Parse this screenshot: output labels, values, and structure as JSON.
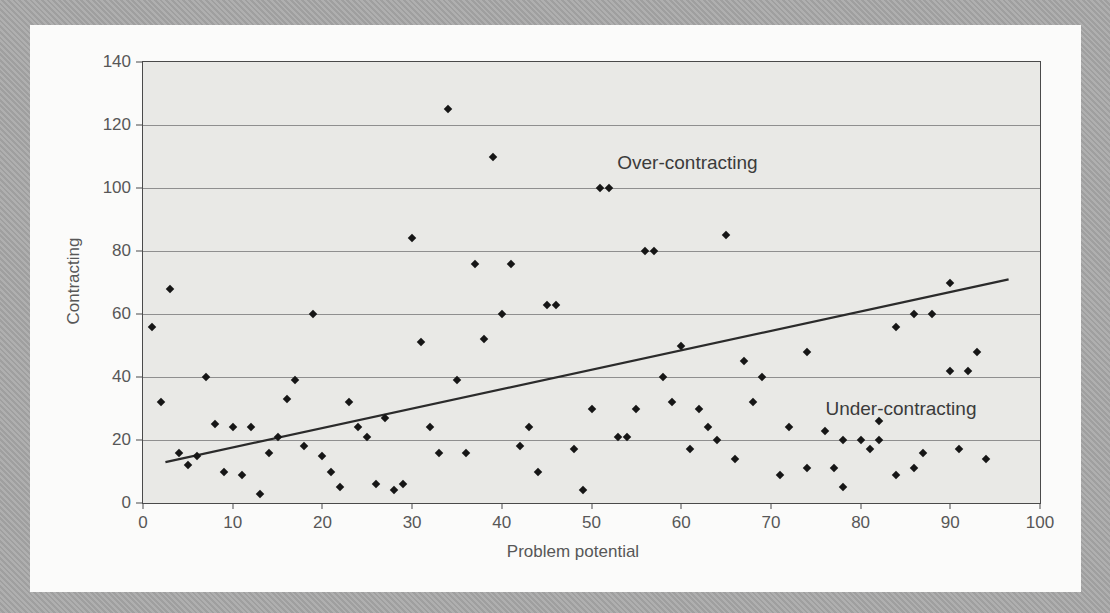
{
  "chart_data": {
    "type": "scatter",
    "title": "",
    "xlabel": "Problem potential",
    "ylabel": "Contracting",
    "xlim": [
      0,
      100
    ],
    "ylim": [
      0,
      140
    ],
    "x_ticks": [
      0,
      10,
      20,
      30,
      40,
      50,
      60,
      70,
      80,
      90,
      100
    ],
    "y_ticks": [
      0,
      20,
      40,
      60,
      80,
      100,
      120,
      140
    ],
    "grid": "horizontal-only",
    "legend": "none",
    "marker": "diamond",
    "annotations": [
      {
        "text": "Over-contracting",
        "x": 60.7,
        "y": 108
      },
      {
        "text": "Under-contracting",
        "x": 84.5,
        "y": 30
      }
    ],
    "trend_line": {
      "x1": 2.5,
      "y1": 13,
      "x2": 96.5,
      "y2": 71
    },
    "points": [
      [
        1,
        56
      ],
      [
        2,
        32
      ],
      [
        3,
        68
      ],
      [
        4,
        16
      ],
      [
        5,
        12
      ],
      [
        6,
        15
      ],
      [
        7,
        40
      ],
      [
        8,
        25
      ],
      [
        9,
        10
      ],
      [
        10,
        24
      ],
      [
        11,
        9
      ],
      [
        12,
        24
      ],
      [
        13,
        3
      ],
      [
        14,
        16
      ],
      [
        15,
        21
      ],
      [
        16,
        33
      ],
      [
        17,
        39
      ],
      [
        18,
        18
      ],
      [
        19,
        60
      ],
      [
        20,
        15
      ],
      [
        21,
        10
      ],
      [
        22,
        5
      ],
      [
        23,
        32
      ],
      [
        24,
        24
      ],
      [
        25,
        21
      ],
      [
        26,
        6
      ],
      [
        27,
        27
      ],
      [
        28,
        4
      ],
      [
        29,
        6
      ],
      [
        30,
        84
      ],
      [
        31,
        51
      ],
      [
        32,
        24
      ],
      [
        33,
        16
      ],
      [
        34,
        125
      ],
      [
        35,
        39
      ],
      [
        36,
        16
      ],
      [
        37,
        76
      ],
      [
        38,
        52
      ],
      [
        39,
        110
      ],
      [
        40,
        60
      ],
      [
        41,
        76
      ],
      [
        42,
        18
      ],
      [
        43,
        24
      ],
      [
        44,
        10
      ],
      [
        45,
        63
      ],
      [
        46,
        63
      ],
      [
        48,
        17
      ],
      [
        49,
        4
      ],
      [
        50,
        30
      ],
      [
        51,
        100
      ],
      [
        52,
        100
      ],
      [
        53,
        21
      ],
      [
        54,
        21
      ],
      [
        55,
        30
      ],
      [
        56,
        80
      ],
      [
        57,
        80
      ],
      [
        58,
        40
      ],
      [
        59,
        32
      ],
      [
        60,
        50
      ],
      [
        61,
        17
      ],
      [
        62,
        30
      ],
      [
        63,
        24
      ],
      [
        64,
        20
      ],
      [
        65,
        85
      ],
      [
        66,
        14
      ],
      [
        67,
        45
      ],
      [
        68,
        32
      ],
      [
        69,
        40
      ],
      [
        71,
        9
      ],
      [
        72,
        24
      ],
      [
        74,
        11
      ],
      [
        74,
        48
      ],
      [
        76,
        23
      ],
      [
        77,
        11
      ],
      [
        78,
        5
      ],
      [
        78,
        20
      ],
      [
        80,
        20
      ],
      [
        81,
        17
      ],
      [
        82,
        20
      ],
      [
        82,
        26
      ],
      [
        84,
        9
      ],
      [
        84,
        56
      ],
      [
        86,
        11
      ],
      [
        86,
        60
      ],
      [
        87,
        16
      ],
      [
        88,
        60
      ],
      [
        90,
        42
      ],
      [
        90,
        70
      ],
      [
        91,
        17
      ],
      [
        92,
        42
      ],
      [
        93,
        48
      ],
      [
        94,
        14
      ]
    ]
  },
  "colors": {
    "page_bg": "#a9a9a9",
    "card_bg": "#fbfbfa",
    "plot_bg": "#e9e9e6",
    "gridline": "#8f8f8f",
    "frame": "#4a4a4a",
    "marker": "#161616",
    "trend_line": "#2b2b2b",
    "tick_text": "#575757",
    "annotation_text": "#3b3b3b"
  }
}
